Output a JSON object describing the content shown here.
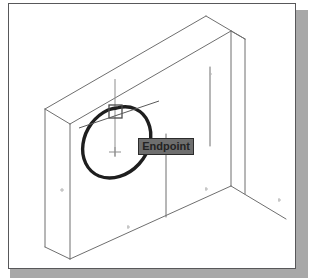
{
  "app": {
    "kind": "cad-viewport-screenshot",
    "description": "Isometric CAD drawing of a wall/box with an object-snap Endpoint tooltip"
  },
  "frame": {
    "border_color": "#58585a",
    "background_color": "#ffffff",
    "shadow_color": "#a8a8a8"
  },
  "tooltip": {
    "label": "Endpoint",
    "background_color": "#6e6e6e",
    "border_color": "#2b2b2b",
    "text_color": "#232323"
  },
  "cursor": {
    "snap_marker_name": "endpoint-snap-square",
    "snap_marker_color": "#4a4a4a",
    "crosshair_color": "#8d8d8d"
  },
  "annotation": {
    "shape": "ellipse",
    "stroke_color": "#1e1e1e",
    "description": "Hand-drawn highlight circle around the snapped corner"
  },
  "geometry": {
    "line_color": "#6f6f6f",
    "description": "Isometric box: wall with top slab, side face, and floor lines"
  }
}
